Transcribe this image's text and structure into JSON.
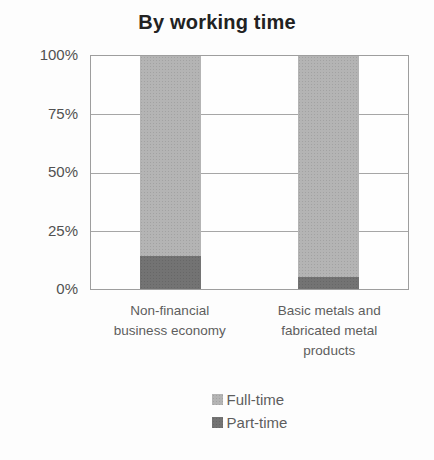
{
  "chart_data": {
    "type": "bar",
    "stacked": true,
    "title": "By working time",
    "categories": [
      "Non-financial business economy",
      "Basic metals and fabricated metal products"
    ],
    "category_labels_lines": [
      [
        "Non-financial",
        "business economy"
      ],
      [
        "Basic metals and",
        "fabricated metal",
        "products"
      ]
    ],
    "series": [
      {
        "name": "Full-time",
        "values": [
          86,
          95
        ],
        "color": "#b4b4b4"
      },
      {
        "name": "Part-time",
        "values": [
          14,
          5
        ],
        "color": "#737373"
      }
    ],
    "ylabel": "",
    "ylim": [
      0,
      100
    ],
    "yticks": [
      "100%",
      "75%",
      "50%",
      "25%",
      "0%"
    ],
    "grid": true,
    "legend_position": "bottom"
  }
}
